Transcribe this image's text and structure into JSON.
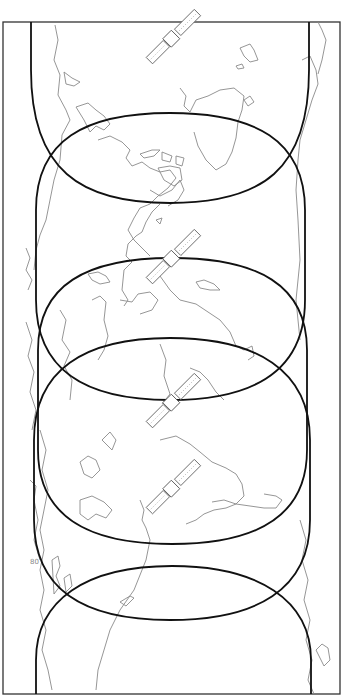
{
  "diagram": {
    "orientation": "rotated 90 degrees",
    "colors": {
      "frame": "#333333",
      "footprint": "#111111",
      "coastline": "#8a8a8a",
      "satellite": "#555555",
      "background": "#ffffff"
    },
    "frame": {
      "x": 3,
      "y": 22,
      "width": 337,
      "height": 672
    },
    "footprints": [
      {
        "id": "footprint-1",
        "label": "",
        "extent_y": [
          22,
          203
        ]
      },
      {
        "id": "footprint-2",
        "label": "",
        "extent_y": [
          113,
          400
        ]
      },
      {
        "id": "footprint-3",
        "label": "",
        "extent_y": [
          258,
          544
        ]
      },
      {
        "id": "footprint-4",
        "label": "",
        "extent_y": [
          338,
          620
        ]
      },
      {
        "id": "footprint-5",
        "label": "",
        "extent_y": [
          566,
          694
        ]
      }
    ],
    "satellites": [
      {
        "id": "satellite-1",
        "x": 172,
        "y": 38
      },
      {
        "id": "satellite-2",
        "x": 172,
        "y": 258
      },
      {
        "id": "satellite-3",
        "x": 172,
        "y": 402
      },
      {
        "id": "satellite-4",
        "x": 172,
        "y": 488
      }
    ],
    "map_labels": [
      "80"
    ]
  }
}
